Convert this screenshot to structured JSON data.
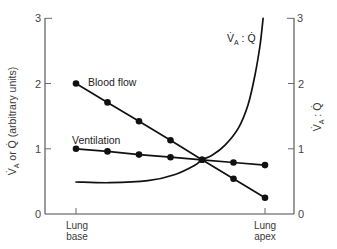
{
  "chart_data": {
    "type": "line",
    "title": "",
    "xlabel": "",
    "ylabel": "V̇A or Q̇ (arbitrary units)",
    "y2label": "V̇A : Q̇",
    "ylim": [
      0,
      3
    ],
    "y2lim": [
      0,
      3
    ],
    "yticks": [
      0,
      1,
      2,
      3
    ],
    "y2ticks": [
      0,
      1,
      2,
      3
    ],
    "grid": false,
    "legend": "none (series labelled inline)",
    "categories": [
      "Lung base",
      "",
      "",
      "",
      "",
      "",
      "Lung apex"
    ],
    "series": [
      {
        "name": "Blood flow",
        "axis": "left",
        "markers": "filled-circle",
        "values": [
          2.0,
          1.71,
          1.42,
          1.13,
          0.83,
          0.54,
          0.25
        ]
      },
      {
        "name": "Ventilation",
        "axis": "left",
        "markers": "filled-circle",
        "values": [
          1.0,
          0.96,
          0.91,
          0.87,
          0.83,
          0.79,
          0.75
        ]
      },
      {
        "name": "V̇A : Q̇",
        "axis": "right",
        "markers": "none",
        "values": [
          0.5,
          0.5,
          0.51,
          0.58,
          0.83,
          1.23,
          3.0
        ],
        "curve_points": [
          [
            0.0,
            0.49
          ],
          [
            0.18,
            0.48
          ],
          [
            0.38,
            0.51
          ],
          [
            0.52,
            0.6
          ],
          [
            0.63,
            0.75
          ],
          [
            0.665,
            0.83
          ],
          [
            0.72,
            0.9
          ],
          [
            0.79,
            1.06
          ],
          [
            0.86,
            1.32
          ],
          [
            0.91,
            1.67
          ],
          [
            0.947,
            2.13
          ],
          [
            0.974,
            2.59
          ],
          [
            0.99,
            3.0
          ]
        ]
      }
    ],
    "annotations": [
      "Blood flow",
      "Ventilation",
      "V̇A : Q̇"
    ]
  },
  "labels": {
    "y_axis_left": {
      "v": "V̇",
      "sub": "A",
      "rest": " or Q̇ (arbitrary units)"
    },
    "y_axis_right": {
      "v": "V̇",
      "sub": "A",
      "rest": " : Q̇"
    },
    "curve_label": {
      "v": "V̇",
      "sub": "A",
      "rest": " : Q̇"
    },
    "blood_flow": "Blood flow",
    "ventilation": "Ventilation",
    "y_ticks_left": [
      "0",
      "1",
      "2",
      "3"
    ],
    "y_ticks_right": [
      "0",
      "1",
      "2",
      "3"
    ],
    "x_base": {
      "line1": "Lung",
      "line2": "base"
    },
    "x_apex": {
      "line1": "Lung",
      "line2": "apex"
    }
  },
  "colors": {
    "background": "#ffffff",
    "line": "#111111",
    "axis": "#4a4a4a",
    "text": "#333333"
  }
}
